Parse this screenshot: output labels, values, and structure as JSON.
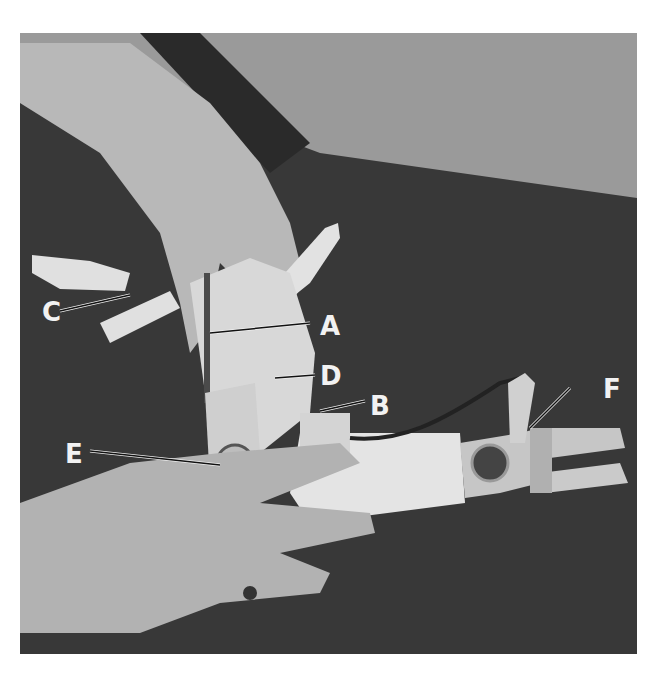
{
  "figure": {
    "colors": {
      "background_wall": "#9a9a9a",
      "table_surface": "#3a3a3a",
      "skin": "#bdbdbd",
      "splint": "#dcdcdc",
      "label_text": "#f2f2f2"
    },
    "callouts": [
      {
        "letter": "A",
        "target": "rod / spring at top of splint"
      },
      {
        "letter": "B",
        "target": "cable attachment block"
      },
      {
        "letter": "C",
        "target": "wire linkage at left"
      },
      {
        "letter": "D",
        "target": "dorsal splint plate"
      },
      {
        "letter": "E",
        "target": "pivot joint / hinge"
      },
      {
        "letter": "F",
        "target": "finger strap"
      }
    ]
  }
}
